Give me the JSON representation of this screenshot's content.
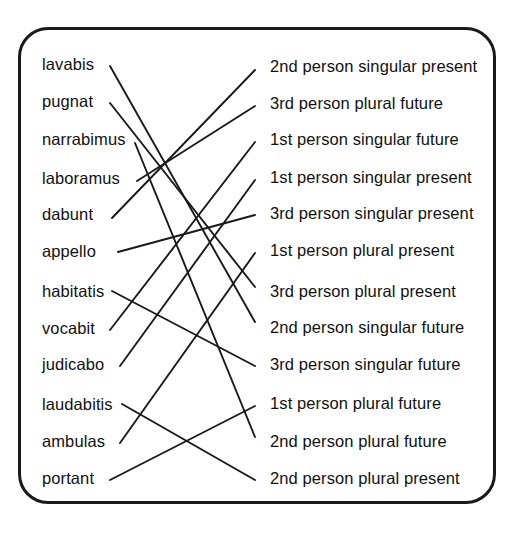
{
  "worksheet": {
    "type": "matching-exercise",
    "title_visible": false,
    "border_color": "#1a1a1a",
    "line_color": "#1a1a1a",
    "text_color": "#111111"
  },
  "left_column": {
    "label": "Latin verb forms",
    "items": [
      {
        "id": "l1",
        "text": "lavabis",
        "y": 64
      },
      {
        "id": "l2",
        "text": "pugnat",
        "y": 101
      },
      {
        "id": "l3",
        "text": "narrabimus",
        "y": 139
      },
      {
        "id": "l4",
        "text": "laboramus",
        "y": 178
      },
      {
        "id": "l5",
        "text": "dabunt",
        "y": 214
      },
      {
        "id": "l6",
        "text": "appello",
        "y": 251
      },
      {
        "id": "l7",
        "text": "habitatis",
        "y": 291
      },
      {
        "id": "l8",
        "text": "vocabit",
        "y": 328
      },
      {
        "id": "l9",
        "text": "judicabo",
        "y": 364
      },
      {
        "id": "l10",
        "text": "laudabitis",
        "y": 404
      },
      {
        "id": "l11",
        "text": "ambulas",
        "y": 441
      },
      {
        "id": "l12",
        "text": "portant",
        "y": 478
      }
    ]
  },
  "right_column": {
    "label": "Grammatical descriptions",
    "items": [
      {
        "id": "r1",
        "text": "2nd person singular present",
        "y": 66
      },
      {
        "id": "r2",
        "text": "3rd person plural future",
        "y": 103
      },
      {
        "id": "r3",
        "text": "1st person singular future",
        "y": 139
      },
      {
        "id": "r4",
        "text": "1st person singular present",
        "y": 177
      },
      {
        "id": "r5",
        "text": "3rd person singular present",
        "y": 213
      },
      {
        "id": "r6",
        "text": "1st person plural present",
        "y": 250
      },
      {
        "id": "r7",
        "text": "3rd person plural present",
        "y": 291
      },
      {
        "id": "r8",
        "text": "2nd person singular future",
        "y": 327
      },
      {
        "id": "r9",
        "text": "3rd person singular future",
        "y": 364
      },
      {
        "id": "r10",
        "text": "1st person plural future",
        "y": 403
      },
      {
        "id": "r11",
        "text": "2nd person plural future",
        "y": 441
      },
      {
        "id": "r12",
        "text": "2nd person plural present",
        "y": 478
      }
    ]
  },
  "connections": [
    {
      "from": "l1",
      "to": "r8",
      "x1": 110,
      "y1": 66,
      "x2": 255,
      "y2": 322
    },
    {
      "from": "l2",
      "to": "r7",
      "x1": 110,
      "y1": 103,
      "x2": 255,
      "y2": 287
    },
    {
      "from": "l3",
      "to": "r11",
      "x1": 135,
      "y1": 143,
      "x2": 255,
      "y2": 437
    },
    {
      "from": "l4",
      "to": "r2",
      "x1": 137,
      "y1": 181,
      "x2": 255,
      "y2": 106
    },
    {
      "from": "l5",
      "to": "r1",
      "x1": 112,
      "y1": 218,
      "x2": 255,
      "y2": 70
    },
    {
      "from": "l6",
      "to": "r5",
      "x1": 118,
      "y1": 252,
      "x2": 255,
      "y2": 215
    },
    {
      "from": "l7",
      "to": "r9",
      "x1": 112,
      "y1": 291,
      "x2": 255,
      "y2": 366
    },
    {
      "from": "l8",
      "to": "r3",
      "x1": 110,
      "y1": 330,
      "x2": 255,
      "y2": 142
    },
    {
      "from": "l9",
      "to": "r4",
      "x1": 120,
      "y1": 366,
      "x2": 255,
      "y2": 180
    },
    {
      "from": "l10",
      "to": "r12",
      "x1": 122,
      "y1": 404,
      "x2": 255,
      "y2": 480
    },
    {
      "from": "l11",
      "to": "r6",
      "x1": 120,
      "y1": 443,
      "x2": 255,
      "y2": 253
    },
    {
      "from": "l12",
      "to": "r10",
      "x1": 110,
      "y1": 480,
      "x2": 255,
      "y2": 406
    }
  ]
}
